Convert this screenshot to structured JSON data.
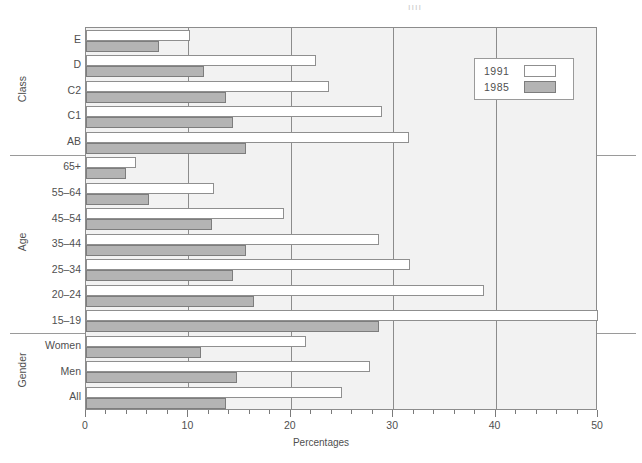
{
  "chart_data": {
    "type": "bar",
    "orientation": "horizontal",
    "title": "",
    "xlabel": "Percentages",
    "ylabel": "",
    "xlim": [
      0,
      50
    ],
    "xticks": [
      0,
      10,
      20,
      30,
      40,
      50
    ],
    "xtick_labels": [
      "0",
      "10",
      "20",
      "30",
      "40",
      "50"
    ],
    "minor_tick_step": 2,
    "grid": "vertical-major",
    "legend_position": "top-right",
    "categories": [
      "E",
      "D",
      "C2",
      "C1",
      "AB",
      "65+",
      "55–64",
      "45–54",
      "35–44",
      "25–34",
      "20–24",
      "15–19",
      "Women",
      "Men",
      "All"
    ],
    "groups": [
      {
        "name": "Class",
        "categories": [
          "E",
          "D",
          "C2",
          "C1",
          "AB"
        ]
      },
      {
        "name": "Age",
        "categories": [
          "65+",
          "55–64",
          "45–54",
          "35–44",
          "25–34",
          "20–24",
          "15–19"
        ]
      },
      {
        "name": "Gender",
        "categories": [
          "Women",
          "Men",
          "All"
        ]
      }
    ],
    "series": [
      {
        "name": "1991",
        "color": "#ffffff",
        "values": [
          10.2,
          22.5,
          23.7,
          28.9,
          31.5,
          4.9,
          12.5,
          19.3,
          28.6,
          31.6,
          38.9,
          50.0,
          21.5,
          27.7,
          25.0
        ]
      },
      {
        "name": "1985",
        "color": "#b4b4b4",
        "values": [
          7.1,
          11.5,
          13.7,
          14.4,
          15.6,
          3.9,
          6.2,
          12.3,
          15.6,
          14.4,
          16.4,
          28.6,
          11.2,
          14.7,
          13.7
        ]
      }
    ]
  },
  "legend": {
    "entries": [
      {
        "label": "1991",
        "swatch": "swatch-1991"
      },
      {
        "label": "1985",
        "swatch": "swatch-1985"
      }
    ]
  },
  "axis": {
    "x_title": "Percentages",
    "tick_labels": [
      "0",
      "10",
      "20",
      "30",
      "40",
      "50"
    ]
  },
  "group_titles": [
    "Class",
    "Age",
    "Gender"
  ],
  "colors": {
    "series_1991": "#ffffff",
    "series_1985": "#b4b4b4",
    "plot_background": "#f2f2f2",
    "frame": "#8c8c8c",
    "text": "#4f4f4f"
  },
  "stray_mark": "ıııı"
}
